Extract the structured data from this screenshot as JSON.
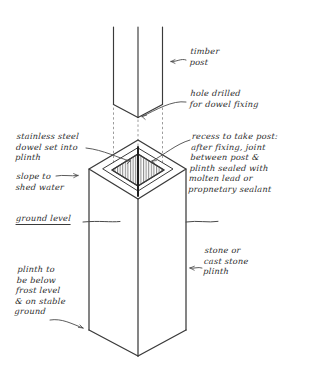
{
  "sheet": {
    "title": "Timber post on stone plinth — fixing detail",
    "background_color": "#ffffff",
    "ink_color": "#2b2b2b",
    "medium": "hand-drawn pencil sketch"
  },
  "annotations": {
    "timber_post": "timber\npost",
    "hole_drilled": "hole drilled\nfor dowel fixing",
    "stainless_dowel": "stainless steel\ndowel set into\nplinth",
    "slope_shed_water": "slope to\nshed water",
    "ground_level": "ground level",
    "recess_take_post": "recess to take post:\nafter fixing, joint\nbetween post &\n  plinth sealed with\n  molten lead or\n  propnetary sealant",
    "stone_plinth": "stone or\ncast stone\nplinth",
    "plinth_frost_level": "plinth to\nbe below\nfrost level\n& on stable\nground"
  },
  "drawing": {
    "components": [
      "timber-post",
      "stone-plinth",
      "recess-in-plinth",
      "stainless-dowel",
      "alignment-dotted-lines",
      "ground-level-line"
    ],
    "projection": "isometric",
    "post_label": "timber post shown raised above plinth",
    "plinth_label": "stone or cast stone plinth"
  }
}
